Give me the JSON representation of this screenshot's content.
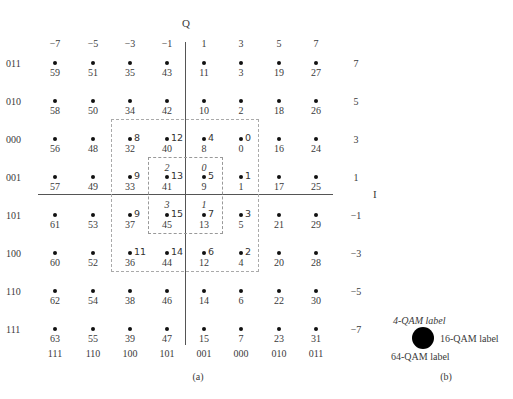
{
  "figure": {
    "q_axis_label": "Q",
    "i_axis_label": "I",
    "top_tick_labels": [
      "−7",
      "−5",
      "−3",
      "−1",
      "1",
      "3",
      "5",
      "7"
    ],
    "right_tick_labels": [
      "7",
      "5",
      "3",
      "1",
      "−1",
      "−3",
      "−5",
      "−7"
    ],
    "left_gray_labels": [
      "011",
      "010",
      "000",
      "001",
      "101",
      "100",
      "110",
      "111"
    ],
    "bottom_gray_labels": [
      "111",
      "110",
      "100",
      "101",
      "001",
      "000",
      "010",
      "011"
    ],
    "grid_64qam_labels": [
      [
        "59",
        "51",
        "35",
        "43",
        "11",
        "3",
        "19",
        "27"
      ],
      [
        "58",
        "50",
        "34",
        "42",
        "10",
        "2",
        "18",
        "26"
      ],
      [
        "56",
        "48",
        "32",
        "40",
        "8",
        "0",
        "16",
        "24"
      ],
      [
        "57",
        "49",
        "33",
        "41",
        "9",
        "1",
        "17",
        "25"
      ],
      [
        "61",
        "53",
        "37",
        "45",
        "13",
        "5",
        "21",
        "29"
      ],
      [
        "60",
        "52",
        "36",
        "44",
        "12",
        "4",
        "20",
        "28"
      ],
      [
        "62",
        "54",
        "38",
        "46",
        "14",
        "6",
        "22",
        "30"
      ],
      [
        "63",
        "55",
        "39",
        "47",
        "15",
        "7",
        "23",
        "31"
      ]
    ],
    "labels_16qam": [
      [
        "8",
        "12",
        "4",
        "0"
      ],
      [
        "9",
        "13",
        "5",
        "1"
      ],
      [
        "9",
        "15",
        "7",
        "3"
      ],
      [
        "11",
        "14",
        "6",
        "2"
      ]
    ],
    "labels_4qam": [
      [
        "2",
        "0"
      ],
      [
        "3",
        "1"
      ]
    ],
    "caption_a": "(a)",
    "legend": {
      "label_4qam": "4-QAM label",
      "label_16qam": "16-QAM label",
      "label_64qam": "64-QAM label",
      "caption_b": "(b)"
    }
  }
}
